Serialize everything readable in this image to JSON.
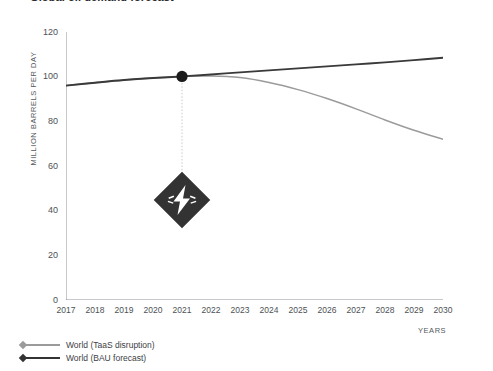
{
  "chart_data": {
    "type": "line",
    "title": "Global oil demand forecast",
    "xlabel": "YEARS",
    "ylabel": "MILLION BARRELS PER DAY",
    "xlim": [
      2017,
      2030
    ],
    "ylim": [
      0,
      120
    ],
    "grid": false,
    "legend_position": "bottom-left",
    "x": [
      2017,
      2018,
      2019,
      2020,
      2021,
      2022,
      2023,
      2024,
      2025,
      2026,
      2027,
      2028,
      2029,
      2030
    ],
    "xticklabels": [
      "2017",
      "2018",
      "2019",
      "2020",
      "2021",
      "2022",
      "2023",
      "2024",
      "2025",
      "2026",
      "2027",
      "2028",
      "2029",
      "2030"
    ],
    "yticklabels": [
      "0",
      "20",
      "40",
      "60",
      "80",
      "100",
      "120"
    ],
    "yticks": [
      0,
      20,
      40,
      60,
      80,
      100,
      120
    ],
    "series": [
      {
        "name": "World (TaaS disruption)",
        "color": "#9b9b9b",
        "values": [
          96.0,
          97.3,
          98.5,
          99.4,
          100.1,
          100.3,
          99.6,
          97.4,
          94.2,
          90.2,
          85.6,
          80.6,
          76.0,
          72.0
        ]
      },
      {
        "name": "World (BAU forecast)",
        "color": "#3a3a3a",
        "values": [
          96.0,
          97.3,
          98.5,
          99.4,
          100.1,
          101.0,
          101.9,
          102.8,
          103.7,
          104.6,
          105.5,
          106.4,
          107.4,
          108.5
        ]
      }
    ],
    "annotations": [
      {
        "name": "disruption-point",
        "marker": "dot",
        "x": 2021,
        "y": 100.1,
        "color": "#1c1c1c"
      },
      {
        "name": "disruption-badge",
        "icon": "lightning-bolt-diamond",
        "x": 2021,
        "y": 45,
        "color": "#333333"
      }
    ]
  },
  "legend": {
    "items": [
      {
        "label": "World (TaaS disruption)",
        "color": "#9b9b9b"
      },
      {
        "label": "World (BAU forecast)",
        "color": "#333333"
      }
    ]
  }
}
